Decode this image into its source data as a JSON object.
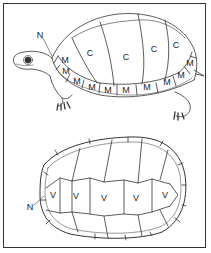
{
  "figure": {
    "line_color": "#333333",
    "background": "#ffffff"
  },
  "lateral_view": {
    "labels": [
      {
        "text": "N",
        "x": 40,
        "y": 35
      },
      {
        "text": "C",
        "x": 90,
        "y": 53
      },
      {
        "text": "C",
        "x": 126,
        "y": 57
      },
      {
        "text": "C",
        "x": 154,
        "y": 49
      },
      {
        "text": "C",
        "x": 176,
        "y": 45
      },
      {
        "text": "M",
        "x": 65,
        "y": 60
      },
      {
        "text": "M",
        "x": 66,
        "y": 71
      },
      {
        "text": "M",
        "x": 77,
        "y": 81
      },
      {
        "text": "M",
        "x": 92,
        "y": 87
      },
      {
        "text": "M",
        "x": 108,
        "y": 90
      },
      {
        "text": "M",
        "x": 126,
        "y": 90
      },
      {
        "text": "M",
        "x": 147,
        "y": 87
      },
      {
        "text": "M",
        "x": 167,
        "y": 82
      },
      {
        "text": "M",
        "x": 181,
        "y": 75
      },
      {
        "text": "M",
        "x": 190,
        "y": 63
      }
    ]
  },
  "dorsal_view": {
    "labels": [
      {
        "text": "N",
        "x": 30,
        "y": 207
      },
      {
        "text": "V",
        "x": 53,
        "y": 195
      },
      {
        "text": "V",
        "x": 76,
        "y": 196
      },
      {
        "text": "V",
        "x": 104,
        "y": 198
      },
      {
        "text": "V",
        "x": 136,
        "y": 198
      },
      {
        "text": "V",
        "x": 165,
        "y": 195
      }
    ]
  }
}
